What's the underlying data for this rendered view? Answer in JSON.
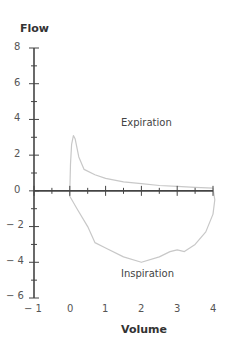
{
  "chart_data": {
    "type": "line",
    "title": "",
    "xlabel": "Volume",
    "ylabel": "Flow",
    "xlim": [
      -1,
      4
    ],
    "ylim": [
      -6,
      8
    ],
    "x_ticks": [
      -1,
      0,
      1,
      2,
      3,
      4
    ],
    "y_ticks": [
      -6,
      -4,
      -2,
      0,
      2,
      4,
      6,
      8
    ],
    "x_minor_step": 0.5,
    "y_minor_step": 1,
    "grid": false,
    "legend": null,
    "annotations": [
      {
        "text": "Expiration",
        "x": 2.1,
        "y": 3.7
      },
      {
        "text": "Inspiration",
        "x": 2.0,
        "y": -4.8
      }
    ],
    "series": [
      {
        "name": "Flow-volume loop",
        "color": "#c8c8c8",
        "points": [
          [
            0.0,
            0.0
          ],
          [
            0.02,
            1.5
          ],
          [
            0.05,
            2.6
          ],
          [
            0.1,
            3.1
          ],
          [
            0.15,
            2.9
          ],
          [
            0.25,
            1.9
          ],
          [
            0.4,
            1.2
          ],
          [
            0.7,
            0.9
          ],
          [
            1.0,
            0.7
          ],
          [
            1.5,
            0.5
          ],
          [
            2.0,
            0.4
          ],
          [
            2.5,
            0.3
          ],
          [
            3.0,
            0.25
          ],
          [
            3.5,
            0.2
          ],
          [
            4.0,
            0.15
          ],
          [
            4.05,
            -0.5
          ],
          [
            4.0,
            -1.3
          ],
          [
            3.8,
            -2.3
          ],
          [
            3.5,
            -3.0
          ],
          [
            3.2,
            -3.4
          ],
          [
            3.0,
            -3.3
          ],
          [
            2.8,
            -3.4
          ],
          [
            2.5,
            -3.7
          ],
          [
            2.0,
            -4.0
          ],
          [
            1.5,
            -3.7
          ],
          [
            1.0,
            -3.2
          ],
          [
            0.7,
            -2.9
          ],
          [
            0.5,
            -2.0
          ],
          [
            0.2,
            -1.0
          ],
          [
            0.0,
            -0.3
          ],
          [
            0.0,
            0.0
          ]
        ]
      }
    ]
  },
  "labels": {
    "ylabel": "Flow",
    "xlabel": "Volume",
    "expiration": "Expiration",
    "inspiration": "Inspiration",
    "y_ticks": [
      "8",
      "6",
      "4",
      "2",
      "0",
      "− 2",
      "− 4",
      "− 6"
    ],
    "x_ticks": [
      "− 1",
      "0",
      "1",
      "2",
      "3",
      "4"
    ]
  }
}
